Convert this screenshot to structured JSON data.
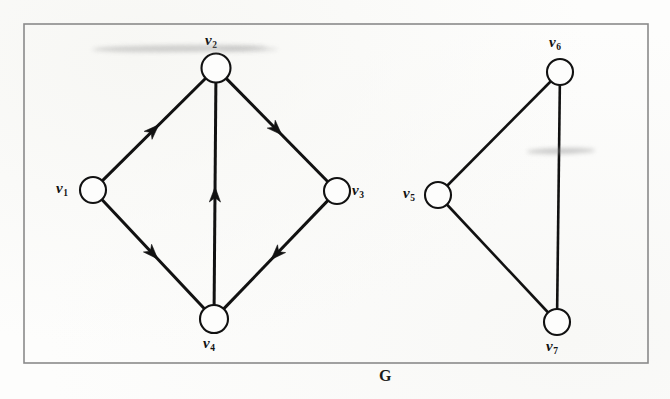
{
  "figure": {
    "caption": "G",
    "caption_position": {
      "x": 379,
      "y": 368
    },
    "frame": {
      "x": 24,
      "y": 24,
      "width": 624,
      "height": 339,
      "stroke": "#8a8a8a",
      "stroke_width": 1.6
    },
    "background_color": "#fdfdfc",
    "ink_color": "#111111"
  },
  "chart_data": {
    "type": "diagram",
    "title": "G",
    "nodes": [
      {
        "id": "v1",
        "label": "v",
        "subscript": "1",
        "cx": 93,
        "cy": 190,
        "r": 13,
        "label_x": 56,
        "label_y": 181,
        "label_anchor": "left"
      },
      {
        "id": "v2",
        "label": "v",
        "subscript": "2",
        "cx": 216,
        "cy": 68,
        "r": 14.5,
        "label_x": 205,
        "label_y": 33,
        "label_anchor": "top"
      },
      {
        "id": "v3",
        "label": "v",
        "subscript": "3",
        "cx": 337,
        "cy": 191,
        "r": 13,
        "label_x": 352,
        "label_y": 183,
        "label_anchor": "right"
      },
      {
        "id": "v4",
        "label": "v",
        "subscript": "4",
        "cx": 214,
        "cy": 319,
        "r": 14,
        "label_x": 203,
        "label_y": 336,
        "label_anchor": "bottom"
      },
      {
        "id": "v5",
        "label": "v",
        "subscript": "5",
        "cx": 438,
        "cy": 195,
        "r": 13,
        "label_x": 403,
        "label_y": 186,
        "label_anchor": "left"
      },
      {
        "id": "v6",
        "label": "v",
        "subscript": "6",
        "cx": 560,
        "cy": 72,
        "r": 13,
        "label_x": 549,
        "label_y": 35,
        "label_anchor": "top"
      },
      {
        "id": "v7",
        "label": "v",
        "subscript": "7",
        "cx": 557,
        "cy": 322,
        "r": 13,
        "label_x": 546,
        "label_y": 339,
        "label_anchor": "bottom"
      }
    ],
    "edges": [
      {
        "id": "e-v1-v2",
        "from": "v1",
        "to": "v2",
        "directed": true,
        "arrow_t": 0.5,
        "stroke_width": 3.0
      },
      {
        "id": "e-v2-v3",
        "from": "v2",
        "to": "v3",
        "directed": true,
        "arrow_t": 0.5,
        "stroke_width": 3.0
      },
      {
        "id": "e-v1-v4",
        "from": "v1",
        "to": "v4",
        "directed": true,
        "arrow_t": 0.5,
        "stroke_width": 3.0
      },
      {
        "id": "e-v3-v4",
        "from": "v3",
        "to": "v4",
        "directed": true,
        "arrow_t": 0.5,
        "stroke_width": 3.0
      },
      {
        "id": "e-v4-v2",
        "from": "v4",
        "to": "v2",
        "directed": true,
        "arrow_t": 0.5,
        "stroke_width": 3.0
      },
      {
        "id": "e-v5-v6",
        "from": "v5",
        "to": "v6",
        "directed": false,
        "stroke_width": 2.6
      },
      {
        "id": "e-v6-v7",
        "from": "v6",
        "to": "v7",
        "directed": false,
        "stroke_width": 2.6
      },
      {
        "id": "e-v5-v7",
        "from": "v5",
        "to": "v7",
        "directed": false,
        "stroke_width": 2.6
      }
    ],
    "legend_position": "none",
    "grid": false
  },
  "artifacts": {
    "smudges": [
      {
        "name": "smudge-top-left",
        "x": 92,
        "y": 45,
        "width": 175,
        "height": 7,
        "color": "rgba(150,150,150,0.42)",
        "rotate": -0.6
      },
      {
        "name": "smudge-top-right",
        "x": 218,
        "y": 47,
        "width": 60,
        "height": 5,
        "color": "rgba(165,165,165,0.30)",
        "rotate": -0.6
      },
      {
        "name": "smudge-mid-right",
        "x": 527,
        "y": 148,
        "width": 68,
        "height": 6,
        "color": "rgba(145,145,145,0.45)",
        "rotate": -1.2
      }
    ]
  }
}
